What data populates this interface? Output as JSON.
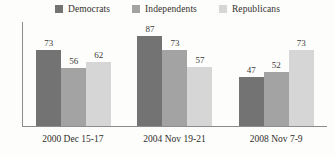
{
  "chart_data": {
    "type": "bar",
    "title": "",
    "subtitle": "",
    "xlabel": "",
    "ylabel": "",
    "ylim": [
      0,
      100
    ],
    "grid": false,
    "legend_position": "top",
    "categories": [
      "2000 Dec 15-17",
      "2004 Nov 19-21",
      "2008 Nov 7-9"
    ],
    "series": [
      {
        "name": "Democrats",
        "color": "#737373",
        "values": [
          73,
          87,
          47
        ]
      },
      {
        "name": "Independents",
        "color": "#a3a3a3",
        "values": [
          56,
          73,
          52
        ]
      },
      {
        "name": "Republicans",
        "color": "#d6d6d6",
        "values": [
          62,
          57,
          73
        ]
      }
    ]
  },
  "legend": {
    "items": [
      {
        "label": "Democrats",
        "color": "#737373"
      },
      {
        "label": "Independents",
        "color": "#a3a3a3"
      },
      {
        "label": "Republicans",
        "color": "#d6d6d6"
      }
    ]
  },
  "axis": {
    "line_color": "#8c8c8c"
  },
  "groups": [
    {
      "category": "2000 Dec 15-17",
      "bars": [
        {
          "series": "Democrats",
          "value": 73,
          "label": "73",
          "color": "#737373"
        },
        {
          "series": "Independents",
          "value": 56,
          "label": "56",
          "color": "#a3a3a3"
        },
        {
          "series": "Republicans",
          "value": 62,
          "label": "62",
          "color": "#d6d6d6"
        }
      ]
    },
    {
      "category": "2004 Nov 19-21",
      "bars": [
        {
          "series": "Democrats",
          "value": 87,
          "label": "87",
          "color": "#737373"
        },
        {
          "series": "Independents",
          "value": 73,
          "label": "73",
          "color": "#a3a3a3"
        },
        {
          "series": "Republicans",
          "value": 57,
          "label": "57",
          "color": "#d6d6d6"
        }
      ]
    },
    {
      "category": "2008 Nov 7-9",
      "bars": [
        {
          "series": "Democrats",
          "value": 47,
          "label": "47",
          "color": "#737373"
        },
        {
          "series": "Independents",
          "value": 52,
          "label": "52",
          "color": "#a3a3a3"
        },
        {
          "series": "Republicans",
          "value": 73,
          "label": "73",
          "color": "#d6d6d6"
        }
      ]
    }
  ]
}
